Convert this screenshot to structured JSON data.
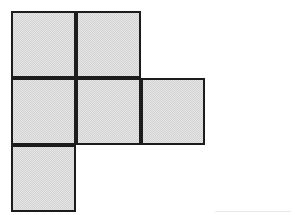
{
  "figure": {
    "square_count": 6,
    "fill_color": "#e6e6e6",
    "dither_color": "#d2d2d2",
    "stroke_color": "#1c1c1c",
    "stroke_width_px": 2,
    "background_color": "#ffffff",
    "cell_width_px": 65,
    "cell_height_px": 67,
    "grid_origin": {
      "x": 11,
      "y": 11
    },
    "grid_columns": 3,
    "grid_rows": 3,
    "squares": [
      {
        "name": "square-r0-c0",
        "row": 0,
        "col": 0,
        "x": 11,
        "y": 11,
        "w": 65,
        "h": 67
      },
      {
        "name": "square-r0-c1",
        "row": 0,
        "col": 1,
        "x": 76,
        "y": 11,
        "w": 65,
        "h": 67
      },
      {
        "name": "square-r1-c0",
        "row": 1,
        "col": 0,
        "x": 11,
        "y": 78,
        "w": 65,
        "h": 67
      },
      {
        "name": "square-r1-c1",
        "row": 1,
        "col": 1,
        "x": 76,
        "y": 78,
        "w": 65,
        "h": 67
      },
      {
        "name": "square-r1-c2",
        "row": 1,
        "col": 2,
        "x": 141,
        "y": 78,
        "w": 64,
        "h": 67
      },
      {
        "name": "square-r2-c0",
        "row": 2,
        "col": 0,
        "x": 11,
        "y": 145,
        "w": 65,
        "h": 67
      }
    ],
    "artifacts": [
      {
        "name": "faint-baseline-rule",
        "x": 215,
        "y": 211,
        "w": 76,
        "h": 1,
        "color": "#e9e9e9"
      }
    ]
  }
}
